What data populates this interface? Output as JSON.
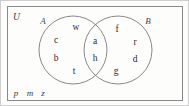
{
  "diagram": {
    "type": "venn",
    "universe": {
      "label": "U",
      "shape": "rectangle"
    },
    "sets": [
      {
        "id": "A",
        "label": "A",
        "shape": "circle"
      },
      {
        "id": "B",
        "label": "B",
        "shape": "circle"
      }
    ],
    "regions": {
      "a_only": {
        "name": "A only",
        "elements": [
          "w",
          "c",
          "b",
          "t"
        ]
      },
      "intersection": {
        "name": "A and B",
        "elements": [
          "a",
          "h"
        ]
      },
      "b_only": {
        "name": "B only",
        "elements": [
          "f",
          "r",
          "d",
          "g"
        ]
      },
      "outside": {
        "name": "Outside A and B",
        "elements": [
          "p",
          "m",
          "z"
        ]
      }
    },
    "elements": [
      {
        "text": "w",
        "region": "a_only",
        "x": 75,
        "y": 27
      },
      {
        "text": "c",
        "region": "a_only",
        "x": 55,
        "y": 40
      },
      {
        "text": "b",
        "region": "a_only",
        "x": 55,
        "y": 58
      },
      {
        "text": "t",
        "region": "a_only",
        "x": 73,
        "y": 71
      },
      {
        "text": "a",
        "region": "intersection",
        "x": 94,
        "y": 41
      },
      {
        "text": "h",
        "region": "intersection",
        "x": 94,
        "y": 58
      },
      {
        "text": "f",
        "region": "b_only",
        "x": 116,
        "y": 29
      },
      {
        "text": "r",
        "region": "b_only",
        "x": 134,
        "y": 42
      },
      {
        "text": "d",
        "region": "b_only",
        "x": 134,
        "y": 59
      },
      {
        "text": "g",
        "region": "b_only",
        "x": 115,
        "y": 71
      }
    ],
    "outside_elements": [
      {
        "text": "p",
        "x": 15,
        "y": 92
      },
      {
        "text": "m",
        "x": 29,
        "y": 92
      },
      {
        "text": "z",
        "x": 42,
        "y": 92
      }
    ],
    "set_labels": [
      {
        "text": "A",
        "x": 42,
        "y": 20
      },
      {
        "text": "B",
        "x": 147,
        "y": 20
      }
    ],
    "geometry": {
      "circle_a": {
        "cx": 72,
        "cy": 49,
        "r": 34
      },
      "circle_b": {
        "cx": 117,
        "cy": 49,
        "r": 34
      },
      "rect": {
        "x": 6,
        "y": 5,
        "w": 176,
        "h": 95
      }
    },
    "colors": {
      "stroke": "#8a8a8a",
      "text": "#2b2b2b",
      "background": "#fdfdfc"
    }
  }
}
